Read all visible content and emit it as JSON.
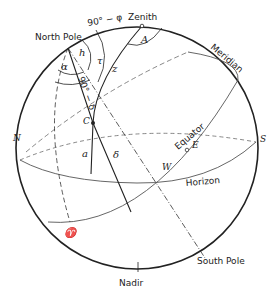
{
  "diagram": {
    "labels": {
      "zenith": "Zenith",
      "nadir": "Nadir",
      "north_pole": "North Pole",
      "south_pole": "South Pole",
      "meridian": "Meridian",
      "equator": "Equator",
      "horizon": "Horizon",
      "north": "N",
      "south": "S",
      "east": "E",
      "west": "W",
      "star": "C",
      "vernal_equinox": "♈",
      "colatitude": "90° − φ",
      "polar_distance": "90° − δ",
      "azimuth": "A",
      "hour_angle": "h",
      "right_ascension": "α",
      "sidereal_time": "τ",
      "zenith_distance": "z",
      "altitude": "a",
      "declination": "δ"
    },
    "colors": {
      "line": "#222222",
      "thin_line": "#555555",
      "background": "#ffffff"
    }
  }
}
